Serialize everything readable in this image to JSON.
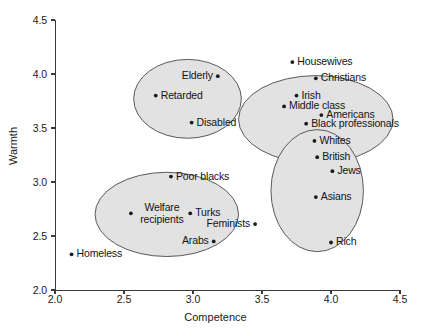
{
  "chart_data": {
    "type": "scatter",
    "title": "",
    "xlabel": "Competence",
    "ylabel": "Warmth",
    "xlim": [
      2.0,
      4.5
    ],
    "ylim": [
      2.0,
      4.5
    ],
    "xticks": [
      "2.0",
      "2.5",
      "3.0",
      "3.5",
      "4.0",
      "4.5"
    ],
    "xtick_values": [
      2.0,
      2.5,
      3.0,
      3.5,
      4.0,
      4.5
    ],
    "yticks": [
      "2.0",
      "2.5",
      "3.0",
      "3.5",
      "4.0",
      "4.5"
    ],
    "ytick_values": [
      2.0,
      2.5,
      3.0,
      3.5,
      4.0,
      4.5
    ],
    "grid": false,
    "legend": "none",
    "points": [
      {
        "label": "Elderly",
        "x": 3.18,
        "y": 3.98,
        "anchor": "right"
      },
      {
        "label": "Retarded",
        "x": 2.73,
        "y": 3.8,
        "anchor": "left"
      },
      {
        "label": "Disabled",
        "x": 2.99,
        "y": 3.55,
        "anchor": "left"
      },
      {
        "label": "Housewives",
        "x": 3.72,
        "y": 4.11,
        "anchor": "left"
      },
      {
        "label": "Christians",
        "x": 3.89,
        "y": 3.96,
        "anchor": "left"
      },
      {
        "label": "Irish",
        "x": 3.75,
        "y": 3.8,
        "anchor": "left"
      },
      {
        "label": "Middle class",
        "x": 3.66,
        "y": 3.7,
        "anchor": "left"
      },
      {
        "label": "Americans",
        "x": 3.93,
        "y": 3.62,
        "anchor": "left"
      },
      {
        "label": "Black professionals",
        "x": 3.82,
        "y": 3.54,
        "anchor": "left"
      },
      {
        "label": "Whites",
        "x": 3.88,
        "y": 3.38,
        "anchor": "left"
      },
      {
        "label": "British",
        "x": 3.9,
        "y": 3.23,
        "anchor": "left"
      },
      {
        "label": "Jews",
        "x": 4.01,
        "y": 3.1,
        "anchor": "left"
      },
      {
        "label": "Asians",
        "x": 3.89,
        "y": 2.86,
        "anchor": "left"
      },
      {
        "label": "Rich",
        "x": 4.0,
        "y": 2.44,
        "anchor": "left"
      },
      {
        "label": "Poor blacks",
        "x": 2.84,
        "y": 3.05,
        "anchor": "left"
      },
      {
        "label": "Welfare recipients",
        "x": 2.55,
        "y": 2.71,
        "anchor": "left"
      },
      {
        "label": "Turks",
        "x": 2.98,
        "y": 2.71,
        "anchor": "left"
      },
      {
        "label": "Feminists",
        "x": 3.45,
        "y": 2.61,
        "anchor": "right"
      },
      {
        "label": "Arabs",
        "x": 3.15,
        "y": 2.45,
        "anchor": "right"
      },
      {
        "label": "Homeless",
        "x": 2.12,
        "y": 2.33,
        "anchor": "left"
      }
    ],
    "clusters": [
      {
        "name": "paternalistic",
        "cx": 2.96,
        "cy": 3.77,
        "rx": 0.39,
        "ry": 0.365
      },
      {
        "name": "admiration",
        "cx": 3.89,
        "cy": 3.58,
        "rx": 0.56,
        "ry": 0.405
      },
      {
        "name": "reference-groups",
        "cx": 3.9,
        "cy": 2.92,
        "rx": 0.335,
        "ry": 0.565
      },
      {
        "name": "contemptuous",
        "cx": 2.81,
        "cy": 2.7,
        "rx": 0.52,
        "ry": 0.39
      }
    ]
  }
}
